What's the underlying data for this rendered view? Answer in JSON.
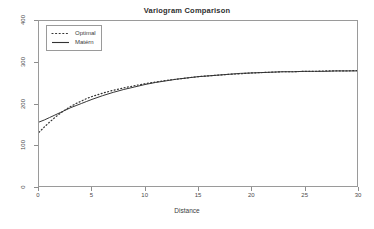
{
  "chart_data": {
    "type": "line",
    "title": "Variogram Comparison",
    "xlabel": "Distance",
    "ylabel": "",
    "xlim": [
      0,
      30
    ],
    "ylim": [
      0,
      400
    ],
    "xticks": [
      "0",
      "5",
      "10",
      "15",
      "20",
      "25",
      "30"
    ],
    "xtick_values": [
      0,
      5,
      10,
      15,
      20,
      25,
      30
    ],
    "yticks": [
      "0",
      "100",
      "200",
      "300",
      "400"
    ],
    "ytick_values": [
      0,
      100,
      200,
      300,
      400
    ],
    "grid": false,
    "legend_position": "top-left",
    "x": [
      0,
      0.5,
      1,
      1.5,
      2,
      2.5,
      3,
      3.5,
      4,
      4.5,
      5,
      6,
      7,
      8,
      9,
      10,
      11,
      12,
      13,
      14,
      15,
      16,
      17,
      18,
      19,
      20,
      21,
      22,
      23,
      24,
      25,
      26,
      27,
      28,
      29,
      30
    ],
    "series": [
      {
        "name": "Optimal",
        "style": "dotted",
        "color": "#333333",
        "values": [
          130,
          143,
          155,
          166,
          176,
          185,
          193,
          200,
          206,
          212,
          217,
          225,
          232,
          238,
          243,
          248,
          252,
          256,
          259,
          262,
          265,
          267,
          269,
          271,
          272,
          274,
          275,
          276,
          277,
          277,
          278,
          278,
          279,
          279,
          279,
          280
        ]
      },
      {
        "name": "Matérn",
        "style": "solid",
        "color": "#333333",
        "values": [
          155,
          160,
          166,
          172,
          178,
          184,
          190,
          195,
          200,
          205,
          210,
          219,
          227,
          234,
          240,
          246,
          251,
          255,
          259,
          262,
          265,
          267,
          269,
          271,
          273,
          274,
          275,
          276,
          277,
          277,
          278,
          278,
          278,
          279,
          279,
          279
        ]
      }
    ],
    "annotations": []
  },
  "legend": {
    "items": [
      {
        "label": "Optimal"
      },
      {
        "label": "Matérn"
      }
    ]
  },
  "colors": {
    "axis": "#8d8d8d",
    "frame": "#9a9a9a",
    "line": "#333333",
    "text": "#3a3a3a",
    "background": "#ffffff"
  }
}
